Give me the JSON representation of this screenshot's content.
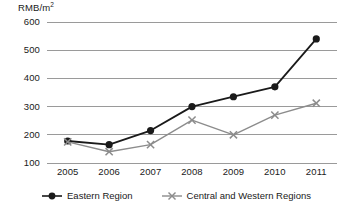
{
  "chart_data": {
    "type": "line",
    "title": "",
    "xlabel": "",
    "ylabel": "RMB/m2",
    "ylabel_display": "RMB/m",
    "ylabel_sup": "2",
    "categories": [
      "2005",
      "2006",
      "2007",
      "2008",
      "2009",
      "2010",
      "2011"
    ],
    "x": [
      2005,
      2006,
      2007,
      2008,
      2009,
      2010,
      2011
    ],
    "ylim": [
      100,
      600
    ],
    "yticks": [
      600,
      500,
      400,
      300,
      200,
      100
    ],
    "grid": true,
    "legend_position": "bottom",
    "series": [
      {
        "name": "Eastern Region",
        "marker": "circle",
        "color": "#1a1a1a",
        "values": [
          178,
          165,
          215,
          300,
          335,
          370,
          540
        ]
      },
      {
        "name": "Central and Western Regions",
        "marker": "x",
        "color": "#8c8c8c",
        "values": [
          175,
          140,
          165,
          252,
          200,
          270,
          312
        ]
      }
    ]
  },
  "legend": {
    "items": [
      {
        "label": "Eastern Region",
        "marker": "circle-marker",
        "color": "#1a1a1a"
      },
      {
        "label": "Central and Western Regions",
        "marker": "x-marker",
        "color": "#8c8c8c"
      }
    ]
  },
  "colors": {
    "eastern": "#1a1a1a",
    "central_western": "#8c8c8c",
    "grid": "#9a9a9a",
    "text": "#1a1a1a",
    "background": "#ffffff"
  }
}
